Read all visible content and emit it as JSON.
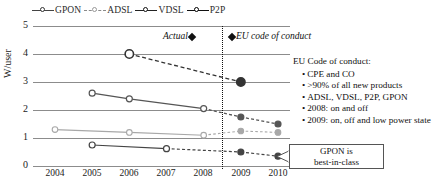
{
  "chart_data": {
    "type": "line",
    "title": "",
    "xlabel": "",
    "ylabel": "W/user",
    "x": [
      2004,
      2005,
      2006,
      2007,
      2008,
      2009,
      2010
    ],
    "xticklabels": [
      "2004",
      "2005",
      "2006",
      "2007",
      "2008",
      "2009",
      "2010"
    ],
    "yticklabels": [
      "0",
      "1",
      "2",
      "3",
      "4",
      "5"
    ],
    "ylim": [
      0,
      5
    ],
    "yticks": [
      0,
      1,
      2,
      3,
      4,
      5
    ],
    "grid": "horizontal",
    "legend_position": "top",
    "series": [
      {
        "name": "ADSL",
        "marker": "open-circle-large",
        "color": "#333333",
        "points": [
          {
            "x": 2006,
            "y": 4.0,
            "segment": "actual"
          },
          {
            "x": 2009,
            "y": 3.0,
            "segment": "target"
          }
        ]
      },
      {
        "name": "GPON",
        "marker": "open-circle",
        "color": "#555555",
        "points": [
          {
            "x": 2005,
            "y": 2.6,
            "segment": "actual"
          },
          {
            "x": 2006,
            "y": 2.4,
            "segment": "actual"
          },
          {
            "x": 2008,
            "y": 2.05,
            "segment": "actual"
          },
          {
            "x": 2009,
            "y": 1.75,
            "segment": "target"
          },
          {
            "x": 2010,
            "y": 1.5,
            "segment": "target"
          }
        ]
      },
      {
        "name": "VDSL",
        "marker": "open-circle",
        "color": "#a8a8a8",
        "points": [
          {
            "x": 2004,
            "y": 1.3,
            "segment": "actual"
          },
          {
            "x": 2006,
            "y": 1.2,
            "segment": "actual"
          },
          {
            "x": 2008,
            "y": 1.1,
            "segment": "actual"
          },
          {
            "x": 2009,
            "y": 1.25,
            "segment": "target"
          },
          {
            "x": 2010,
            "y": 1.2,
            "segment": "target"
          }
        ]
      },
      {
        "name": "P2P",
        "marker": "open-circle",
        "color": "#444444",
        "points": [
          {
            "x": 2005,
            "y": 0.75,
            "segment": "actual"
          },
          {
            "x": 2007,
            "y": 0.62,
            "segment": "actual"
          },
          {
            "x": 2009,
            "y": 0.5,
            "segment": "target"
          },
          {
            "x": 2010,
            "y": 0.35,
            "segment": "target"
          }
        ]
      }
    ],
    "annotations": {
      "divider_year": 2008.5,
      "divider_style": "vertical-dotted",
      "actual_label": "Actual",
      "eu_label": "EU code of conduct"
    }
  },
  "legend": {
    "items": [
      {
        "label": "GPON",
        "dash": "solid",
        "marker": "open",
        "color": "#444444"
      },
      {
        "label": "ADSL",
        "dash": "dashed",
        "marker": "open",
        "color": "#8a8a8a"
      },
      {
        "label": "VDSL",
        "dash": "solid",
        "marker": "open",
        "color": "#222222"
      },
      {
        "label": "P2P",
        "dash": "solid",
        "marker": "filled",
        "color": "#111111"
      }
    ]
  },
  "axes": {
    "y_label": "W/user",
    "y_ticks": [
      "5",
      "4",
      "3",
      "2",
      "1",
      "0"
    ],
    "x_ticks": [
      "2004",
      "2005",
      "2006",
      "2007",
      "2008",
      "2009",
      "2010"
    ]
  },
  "annotation_band": {
    "actual": "Actual",
    "eu": "EU code of conduct"
  },
  "eu_code_panel": {
    "heading": "EU Code of conduct:",
    "bullets": [
      "CPE and CO",
      ">90% of all new products",
      "ADSL, VDSL, P2P, GPON",
      "2008: on and off",
      "2009: on, off and low power state"
    ]
  },
  "callout": {
    "line1": "GPON is",
    "line2": "best-in-class"
  }
}
